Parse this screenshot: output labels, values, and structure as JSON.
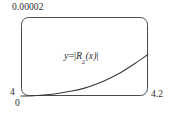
{
  "figure": {
    "name": "taylor-remainder-error-plot",
    "frame": {
      "shape": "rounded-rectangle",
      "x": 21,
      "y": 17,
      "width": 127,
      "height": 79,
      "corner_radius": 7,
      "stroke_color": "#4a4a4a"
    },
    "labels": {
      "y_max": "0.00002",
      "y_origin": "4",
      "x_origin": "0",
      "x_max": "4.2",
      "curve_expression_lhs": "y",
      "curve_expression_eq": "=",
      "curve_expression_fn": "R",
      "curve_expression_sub": "2",
      "curve_expression_arg": "(x)"
    }
  },
  "chart_data": {
    "type": "line",
    "title": "",
    "subtitle": "",
    "xlabel": "",
    "ylabel": "",
    "annotations": [
      {
        "text": "y = |R2(x)|",
        "x": 4.1,
        "y": 1.05e-05
      }
    ],
    "grid": false,
    "legend": null,
    "xlim": [
      4,
      4.2
    ],
    "ylim": [
      0,
      2e-05
    ],
    "x_tick_labels": [
      "4",
      "4.2"
    ],
    "y_tick_labels": [
      "0",
      "0.00002"
    ],
    "y_axis_origin_label": "4",
    "series": [
      {
        "name": "|R2(x)|",
        "color": "#3a3a3a",
        "x": [
          4.0,
          4.02,
          4.04,
          4.06,
          4.08,
          4.1,
          4.12,
          4.14,
          4.16,
          4.18,
          4.2
        ],
        "y": [
          0.0,
          8e-08,
          3e-07,
          7e-07,
          1.25e-06,
          2e-06,
          3.1e-06,
          4.5e-06,
          6.2e-06,
          8.3e-06,
          1.05e-05
        ]
      }
    ]
  }
}
